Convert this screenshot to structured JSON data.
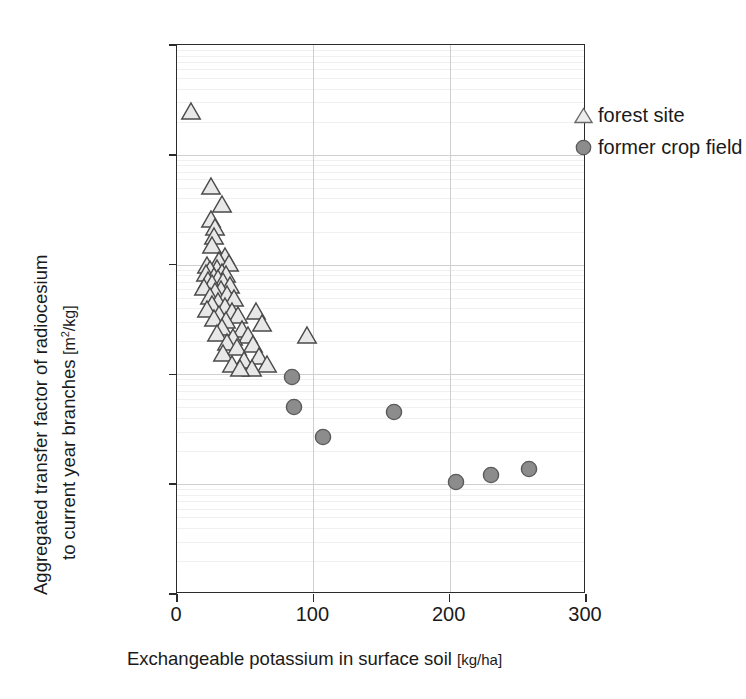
{
  "chart_data": {
    "type": "scatter",
    "title": "",
    "xlabel": "Exchangeable potassium in surface soil [kg/ha]",
    "ylabel_line1": "Aggregated transfer factor of radiocesium",
    "ylabel_line2": "to current year branches",
    "ylabel_unit": "[m²/kg]",
    "xlabel_unit": "[kg/ha]",
    "xlim": [
      0,
      300
    ],
    "ylim": [
      1e-05,
      1
    ],
    "yscale": "log",
    "xscale": "linear",
    "grid": "major gridlines at decades and x=100, 200",
    "legend_position": "top-right inside plot",
    "xticks": [
      "0",
      "100",
      "200",
      "300"
    ],
    "xtick_values": [
      0,
      100,
      200,
      300
    ],
    "yticks": [
      "1",
      "0.1",
      "0.01",
      "0.001",
      "0.0001",
      "0.00001"
    ],
    "ytick_values": [
      1,
      0.1,
      0.01,
      0.001,
      0.0001,
      1e-05
    ],
    "series": [
      {
        "name": "forest site",
        "marker": "open-triangle",
        "fill": "#e8e8e8",
        "stroke": "#4a4a4a",
        "points": [
          [
            10,
            0.24
          ],
          [
            25,
            0.05
          ],
          [
            33,
            0.034
          ],
          [
            25,
            0.025
          ],
          [
            28,
            0.021
          ],
          [
            27,
            0.0175
          ],
          [
            26,
            0.0145
          ],
          [
            35,
            0.0115
          ],
          [
            31,
            0.0105
          ],
          [
            38,
            0.01
          ],
          [
            22,
            0.0095
          ],
          [
            29,
            0.009
          ],
          [
            24,
            0.0088
          ],
          [
            33,
            0.0082
          ],
          [
            21,
            0.008
          ],
          [
            36,
            0.0078
          ],
          [
            27,
            0.0075
          ],
          [
            30,
            0.0072
          ],
          [
            23,
            0.007
          ],
          [
            34,
            0.0068
          ],
          [
            26,
            0.0065
          ],
          [
            39,
            0.0062
          ],
          [
            20,
            0.006
          ],
          [
            32,
            0.0058
          ],
          [
            28,
            0.0055
          ],
          [
            37,
            0.0052
          ],
          [
            24,
            0.005
          ],
          [
            42,
            0.0048
          ],
          [
            30,
            0.0045
          ],
          [
            26,
            0.0042
          ],
          [
            35,
            0.004
          ],
          [
            22,
            0.0038
          ],
          [
            40,
            0.0036
          ],
          [
            31,
            0.0034
          ],
          [
            45,
            0.0033
          ],
          [
            27,
            0.0031
          ],
          [
            36,
            0.003
          ],
          [
            58,
            0.0036
          ],
          [
            62,
            0.0028
          ],
          [
            33,
            0.0026
          ],
          [
            48,
            0.0025
          ],
          [
            29,
            0.0023
          ],
          [
            52,
            0.0022
          ],
          [
            41,
            0.0021
          ],
          [
            95,
            0.0022
          ],
          [
            37,
            0.0019
          ],
          [
            56,
            0.0018
          ],
          [
            44,
            0.0017
          ],
          [
            34,
            0.0015
          ],
          [
            60,
            0.0014
          ],
          [
            49,
            0.0013
          ],
          [
            40,
            0.0012
          ],
          [
            66,
            0.0012
          ],
          [
            55,
            0.0011
          ],
          [
            46,
            0.0011
          ]
        ]
      },
      {
        "name": "former crop field",
        "marker": "filled-circle",
        "fill": "#8c8c8c",
        "stroke": "#5a5a5a",
        "points": [
          [
            84,
            0.00095
          ],
          [
            86,
            0.0005
          ],
          [
            107,
            0.00027
          ],
          [
            159,
            0.00045
          ],
          [
            205,
            0.000105
          ],
          [
            230,
            0.000122
          ],
          [
            258,
            0.000137
          ]
        ]
      }
    ]
  },
  "legend": {
    "items": [
      {
        "label": "forest site",
        "marker": "triangle-open-icon"
      },
      {
        "label": "former crop field",
        "marker": "circle-filled-icon"
      }
    ]
  },
  "colors": {
    "axis": "#2b2b2b",
    "grid_major": "#cfcfcf",
    "grid_minor": "#f0f0f0",
    "text": "#1a1a1a",
    "triangle_fill": "#e8e8e8",
    "triangle_stroke": "#4a4a4a",
    "circle_fill": "#8c8c8c",
    "circle_stroke": "#5a5a5a",
    "background": "#ffffff"
  }
}
